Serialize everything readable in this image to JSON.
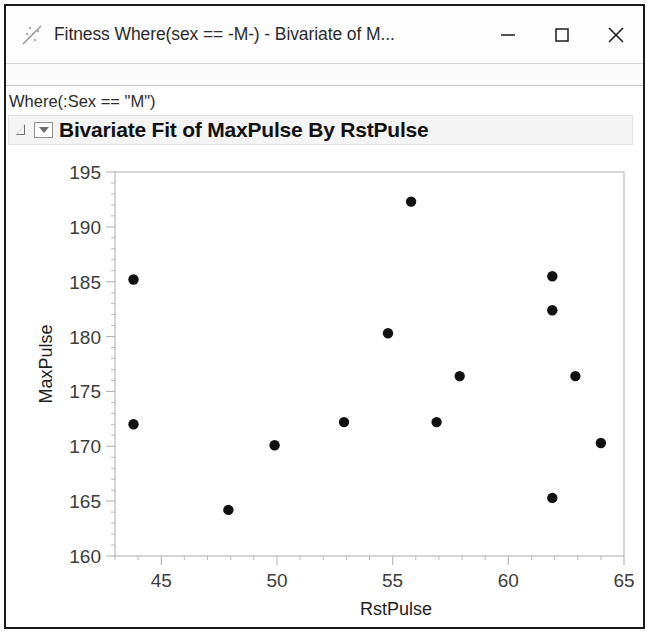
{
  "window": {
    "title": "Fitness Where(sex == -M-) - Bivariate of M...",
    "app_icon": "jmp-scatterplot-icon",
    "controls": {
      "minimize_label": "Minimize",
      "maximize_label": "Maximize",
      "close_label": "Close"
    }
  },
  "report": {
    "where_clause": "Where(:Sex == \"M\")",
    "outline_title": "Bivariate Fit of MaxPulse By RstPulse",
    "disclosure_state": "expanded",
    "menu_icon": "red-triangle-menu-icon"
  },
  "chart_data": {
    "type": "scatter",
    "title": "Bivariate Fit of MaxPulse By RstPulse",
    "xlabel": "RstPulse",
    "ylabel": "MaxPulse",
    "xlim": [
      43,
      65
    ],
    "ylim": [
      160,
      195
    ],
    "xticks": [
      45,
      50,
      55,
      60,
      65
    ],
    "yticks": [
      160,
      165,
      170,
      175,
      180,
      185,
      190,
      195
    ],
    "xtick_labels": [
      "45",
      "50",
      "55",
      "60",
      "65"
    ],
    "ytick_labels": [
      "160",
      "165",
      "170",
      "175",
      "180",
      "185",
      "190",
      "195"
    ],
    "x_minor_step": 1,
    "y_minor_step": 1,
    "grid": false,
    "legend": null,
    "marker": "filled-circle",
    "marker_color": "#111111",
    "points": [
      {
        "x": 43.8,
        "y": 185.2
      },
      {
        "x": 43.8,
        "y": 172.0
      },
      {
        "x": 47.9,
        "y": 164.2
      },
      {
        "x": 49.9,
        "y": 170.1
      },
      {
        "x": 52.9,
        "y": 172.2
      },
      {
        "x": 54.8,
        "y": 180.3
      },
      {
        "x": 55.8,
        "y": 192.3
      },
      {
        "x": 56.9,
        "y": 172.2
      },
      {
        "x": 57.9,
        "y": 176.4
      },
      {
        "x": 61.9,
        "y": 185.5
      },
      {
        "x": 61.9,
        "y": 182.4
      },
      {
        "x": 61.9,
        "y": 165.3
      },
      {
        "x": 62.9,
        "y": 176.4
      },
      {
        "x": 64.0,
        "y": 170.3
      }
    ]
  },
  "colors": {
    "plot_frame": "#b8b8b8",
    "axis_text": "#3c3c3c",
    "marker": "#111111",
    "window_border": "#1a1a1a"
  }
}
